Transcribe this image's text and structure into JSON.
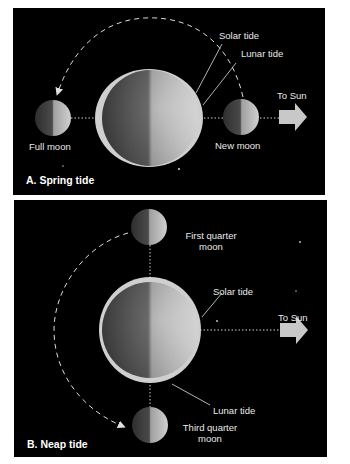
{
  "figure": {
    "panels": [
      {
        "id": "A",
        "title": "A. Spring tide",
        "labels": {
          "solar_tide": "Solar tide",
          "lunar_tide": "Lunar tide",
          "to_sun": "To Sun",
          "moon_left": "Full moon",
          "moon_right": "New moon"
        },
        "tidal_bulge_axis": "horizontal"
      },
      {
        "id": "B",
        "title": "B. Neap tide",
        "labels": {
          "solar_tide": "Solar tide",
          "lunar_tide": "Lunar tide",
          "to_sun": "To Sun",
          "moon_top_line1": "First quarter",
          "moon_top_line2": "moon",
          "moon_bottom_line1": "Third quarter",
          "moon_bottom_line2": "moon"
        },
        "tidal_bulge_axis": "vertical"
      }
    ],
    "colors": {
      "background": "#000000",
      "page": "#ffffff",
      "text": "#e9e9e9",
      "arrow": "#c8c8c8",
      "tide_envelope": "#d9d9d9"
    }
  }
}
